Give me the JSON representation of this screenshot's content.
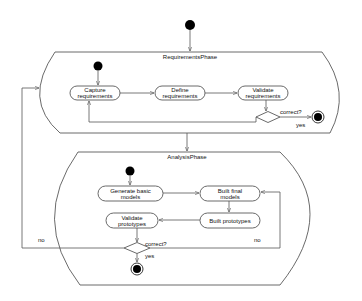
{
  "diagram": {
    "type": "UML activity diagram",
    "phases": [
      {
        "name": "RequirementsPhase",
        "activities": [
          {
            "line1": "Capture",
            "line2": "requirements"
          },
          {
            "line1": "Define",
            "line2": "requirements"
          },
          {
            "line1": "Validate",
            "line2": "requirements"
          }
        ],
        "decision": {
          "label": "correct?",
          "yes_label": "yes"
        }
      },
      {
        "name": "AnalysisPhase",
        "activities": [
          {
            "line1": "Generate basic",
            "line2": "models"
          },
          {
            "line1": "Built final",
            "line2": "models"
          },
          {
            "line1": "Built prototypes",
            "line2": ""
          },
          {
            "line1": "Validate",
            "line2": "prototypes"
          }
        ],
        "decision": {
          "label": "correct?",
          "yes_label": "yes",
          "no_left_label": "no",
          "no_right_label": "no"
        }
      }
    ],
    "colors": {
      "stroke": "#555555",
      "node_fill": "#000000",
      "background": "#ffffff"
    }
  }
}
